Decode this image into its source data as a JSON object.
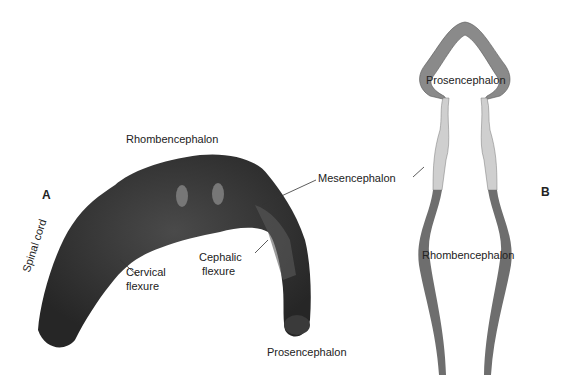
{
  "panels": {
    "a": "A",
    "b": "B"
  },
  "labels_a": {
    "rhombencephalon": "Rhombencephalon",
    "mesencephalon": "Mesencephalon",
    "spinal_cord": "Spinal cord",
    "cervical_flexure_1": "Cervical",
    "cervical_flexure_2": "flexure",
    "cephalic_flexure_1": "Cephalic",
    "cephalic_flexure_2": "flexure",
    "prosencephalon": "Prosencephalon"
  },
  "labels_b": {
    "prosencephalon": "Prosencephalon",
    "rhombencephalon": "Rhombencephalon"
  },
  "colors": {
    "embryo": "#2e2e2e",
    "embryo_light": "#4a4a4a",
    "prosencephalon": "#8a8a8a",
    "mesencephalon": "#cfcfcf",
    "rhombencephalon": "#6e6e6e"
  }
}
